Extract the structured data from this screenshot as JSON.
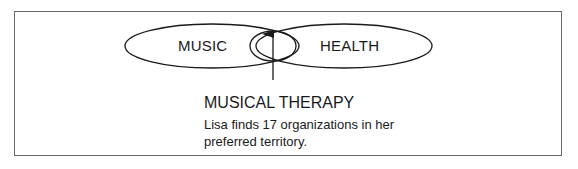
{
  "diagram": {
    "circles": [
      {
        "id": "music",
        "label": "MUSIC"
      },
      {
        "id": "health",
        "label": "HEALTH"
      }
    ],
    "intersection": {
      "title": "MUSICAL THERAPY",
      "description": "Lisa finds 17 organizations in her preferred territory."
    }
  }
}
